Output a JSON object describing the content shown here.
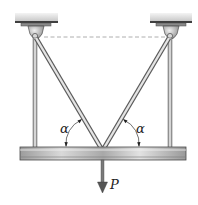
{
  "diagram": {
    "type": "statics-structure",
    "labels": {
      "angle_left": "α",
      "angle_right": "α",
      "load": "P"
    },
    "colors": {
      "steel_light": "#e6e6e6",
      "steel_mid": "#b9b9b9",
      "steel_dark": "#6e6e6e",
      "outline": "#4a4a4a",
      "dashed_line": "#9a9a9a",
      "label": "#222222"
    }
  }
}
